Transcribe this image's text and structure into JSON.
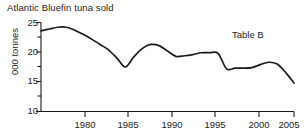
{
  "chart_data": {
    "type": "line",
    "title": "Atlantic Bluefin tuna sold",
    "annotation": "Table B",
    "xlabel": "",
    "ylabel": "000 tonnes",
    "xlim": [
      1975,
      2005
    ],
    "ylim": [
      10,
      25
    ],
    "grid": false,
    "legend": "none",
    "line_color": "#1a1a1a",
    "x_ticks": [
      "1980",
      "1985",
      "1990",
      "1995",
      "2000",
      "2005"
    ],
    "x_tick_values": [
      1980,
      1985,
      1990,
      1995,
      2000,
      2005
    ],
    "y_ticks": [
      "25",
      "20",
      "15",
      "10"
    ],
    "y_tick_values": [
      25,
      20,
      15,
      10
    ],
    "y_minor_tick_values": [
      22.5,
      17.5,
      12.5
    ],
    "series": [
      {
        "name": "Atlantic Bluefin tuna sold",
        "x": [
          1975,
          1976,
          1977,
          1978,
          1979,
          1980,
          1981,
          1982,
          1983,
          1984,
          1985,
          1986,
          1987,
          1988,
          1989,
          1990,
          1991,
          1992,
          1993,
          1994,
          1995,
          1996,
          1997,
          1998,
          1999,
          2000,
          2001,
          2002,
          2003,
          2004,
          2005
        ],
        "values": [
          23.6,
          23.9,
          24.2,
          24.2,
          23.7,
          23.0,
          22.2,
          21.3,
          20.4,
          19.0,
          17.5,
          19.2,
          20.6,
          21.3,
          21.1,
          20.2,
          19.3,
          19.4,
          19.6,
          19.9,
          19.9,
          19.8,
          17.2,
          17.3,
          17.3,
          17.4,
          17.9,
          18.3,
          18.0,
          16.6,
          14.8
        ]
      }
    ]
  },
  "axes": {
    "y_title": "000 tonnes"
  }
}
